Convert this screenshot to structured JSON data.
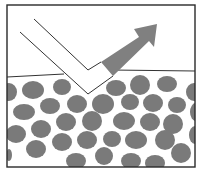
{
  "diagram": {
    "title": "",
    "colors": {
      "background": "#ffffff",
      "frame": "#2a2a2a",
      "line": "#333333",
      "particle": "#7a7a7a",
      "arrow": "#808080"
    },
    "frame": {
      "x": 7,
      "y": 5,
      "width": 188,
      "height": 162
    },
    "surface": {
      "left": {
        "x1": 7,
        "y1": 77,
        "x2": 64,
        "y2": 74
      },
      "right": {
        "x1": 112,
        "y1": 70,
        "x2": 195,
        "y2": 71
      }
    },
    "incident_beam": {
      "inner_line": [
        [
          34,
          19
        ],
        [
          88,
          70
        ],
        [
          101,
          62
        ]
      ],
      "outer_line": [
        [
          20,
          32
        ],
        [
          88,
          94
        ],
        [
          113,
          76
        ]
      ]
    },
    "reflected_arrow": {
      "points": [
        [
          101,
          62
        ],
        [
          139,
          37
        ],
        [
          134,
          29
        ],
        [
          157,
          24
        ],
        [
          154,
          47
        ],
        [
          149,
          41
        ],
        [
          113,
          76
        ]
      ]
    },
    "particles": [
      {
        "cx": 9,
        "cy": 92,
        "rx": 8,
        "ry": 9
      },
      {
        "cx": 33,
        "cy": 90,
        "rx": 11,
        "ry": 9
      },
      {
        "cx": 62,
        "cy": 87,
        "rx": 9,
        "ry": 8
      },
      {
        "cx": 116,
        "cy": 88,
        "rx": 10,
        "ry": 8
      },
      {
        "cx": 140,
        "cy": 85,
        "rx": 10,
        "ry": 10
      },
      {
        "cx": 167,
        "cy": 84,
        "rx": 10,
        "ry": 8
      },
      {
        "cx": 194,
        "cy": 92,
        "rx": 8,
        "ry": 9
      },
      {
        "cx": 50,
        "cy": 106,
        "rx": 10,
        "ry": 8
      },
      {
        "cx": 77,
        "cy": 104,
        "rx": 10,
        "ry": 9
      },
      {
        "cx": 103,
        "cy": 104,
        "rx": 11,
        "ry": 10
      },
      {
        "cx": 130,
        "cy": 102,
        "rx": 9,
        "ry": 8
      },
      {
        "cx": 153,
        "cy": 103,
        "rx": 10,
        "ry": 9
      },
      {
        "cx": 177,
        "cy": 105,
        "rx": 9,
        "ry": 8
      },
      {
        "cx": 24,
        "cy": 112,
        "rx": 11,
        "ry": 8
      },
      {
        "cx": 66,
        "cy": 122,
        "rx": 10,
        "ry": 9
      },
      {
        "cx": 92,
        "cy": 121,
        "rx": 10,
        "ry": 10
      },
      {
        "cx": 124,
        "cy": 121,
        "rx": 11,
        "ry": 9
      },
      {
        "cx": 150,
        "cy": 122,
        "rx": 10,
        "ry": 9
      },
      {
        "cx": 173,
        "cy": 124,
        "rx": 10,
        "ry": 10
      },
      {
        "cx": 196,
        "cy": 112,
        "rx": 6,
        "ry": 9
      },
      {
        "cx": 16,
        "cy": 134,
        "rx": 10,
        "ry": 9
      },
      {
        "cx": 41,
        "cy": 129,
        "rx": 10,
        "ry": 9
      },
      {
        "cx": 62,
        "cy": 142,
        "rx": 10,
        "ry": 9
      },
      {
        "cx": 87,
        "cy": 140,
        "rx": 10,
        "ry": 9
      },
      {
        "cx": 112,
        "cy": 139,
        "rx": 9,
        "ry": 8
      },
      {
        "cx": 136,
        "cy": 140,
        "rx": 11,
        "ry": 9
      },
      {
        "cx": 165,
        "cy": 140,
        "rx": 10,
        "ry": 10
      },
      {
        "cx": 195,
        "cy": 135,
        "rx": 6,
        "ry": 9
      },
      {
        "cx": 36,
        "cy": 149,
        "rx": 10,
        "ry": 9
      },
      {
        "cx": 76,
        "cy": 161,
        "rx": 10,
        "ry": 8
      },
      {
        "cx": 104,
        "cy": 156,
        "rx": 9,
        "ry": 9
      },
      {
        "cx": 131,
        "cy": 161,
        "rx": 10,
        "ry": 8
      },
      {
        "cx": 155,
        "cy": 163,
        "rx": 10,
        "ry": 8
      },
      {
        "cx": 181,
        "cy": 153,
        "rx": 10,
        "ry": 10
      },
      {
        "cx": 9,
        "cy": 155,
        "rx": 3,
        "ry": 6
      }
    ]
  }
}
